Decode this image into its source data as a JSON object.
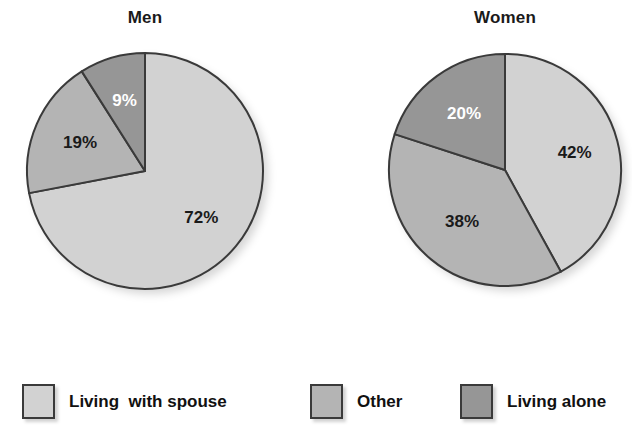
{
  "chart_data": [
    {
      "type": "pie",
      "title": "Men",
      "categories": [
        "Living  with spouse",
        "Other",
        "Living alone"
      ],
      "values": [
        72,
        19,
        9
      ],
      "labels": [
        "72%",
        "19%",
        "9%"
      ],
      "label_colors": [
        "dark",
        "dark",
        "light"
      ],
      "colors": [
        "#d2d2d2",
        "#b4b4b4",
        "#969696"
      ],
      "units": "percent",
      "start_angle_deg": 0,
      "direction": "clockwise",
      "legend_position": "bottom"
    },
    {
      "type": "pie",
      "title": "Women",
      "categories": [
        "Living  with spouse",
        "Other",
        "Living alone"
      ],
      "values": [
        42,
        38,
        20
      ],
      "labels": [
        "42%",
        "38%",
        "20%"
      ],
      "label_colors": [
        "dark",
        "dark",
        "light"
      ],
      "colors": [
        "#d2d2d2",
        "#b4b4b4",
        "#969696"
      ],
      "units": "percent",
      "start_angle_deg": 0,
      "direction": "clockwise",
      "legend_position": "bottom"
    }
  ],
  "legend": {
    "items": [
      {
        "label": "Living  with spouse",
        "color": "#d2d2d2"
      },
      {
        "label": "Other",
        "color": "#b4b4b4"
      },
      {
        "label": "Living alone",
        "color": "#969696"
      }
    ]
  },
  "style": {
    "outline": "#3a3a3a",
    "background": "#ffffff",
    "label_dark": "#1a1a1a",
    "label_light": "#ffffff"
  }
}
